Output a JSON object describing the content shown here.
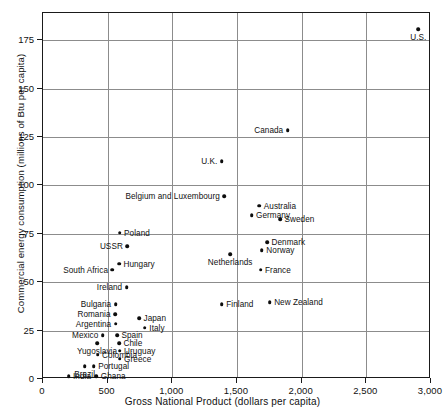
{
  "chart_data": {
    "type": "scatter",
    "title": "",
    "xlabel": "Gross National Product (dollars per capita)",
    "ylabel": "Commercial energy consumption (millions of Btu per capita)",
    "xlim": [
      0,
      3000
    ],
    "ylim": [
      0,
      189
    ],
    "xticks": [
      0,
      500,
      1000,
      1500,
      2000,
      2500,
      3000
    ],
    "xticklabels": [
      "0",
      "500",
      "1,000",
      "1,500",
      "2,000",
      "2,500",
      "3,000"
    ],
    "yticks": [
      0,
      25,
      50,
      75,
      100,
      125,
      150,
      175
    ],
    "yticklabels": [
      "0",
      "25",
      "50",
      "75",
      "100",
      "125",
      "150",
      "175"
    ],
    "grid": true,
    "legend": false,
    "points": [
      {
        "name": "U.S.",
        "x": 2910,
        "y": 180,
        "side": "below"
      },
      {
        "name": "Canada",
        "x": 1900,
        "y": 128,
        "side": "left"
      },
      {
        "name": "U.K.",
        "x": 1390,
        "y": 112,
        "side": "left"
      },
      {
        "name": "Belgium and Luxembourg",
        "x": 1410,
        "y": 94,
        "side": "left"
      },
      {
        "name": "Australia",
        "x": 1680,
        "y": 89,
        "side": "right"
      },
      {
        "name": "Germany",
        "x": 1620,
        "y": 84,
        "side": "right"
      },
      {
        "name": "Sweden",
        "x": 1840,
        "y": 82,
        "side": "right"
      },
      {
        "name": "Poland",
        "x": 600,
        "y": 75,
        "side": "right"
      },
      {
        "name": "Denmark",
        "x": 1740,
        "y": 70,
        "side": "right"
      },
      {
        "name": "Norway",
        "x": 1700,
        "y": 66,
        "side": "right"
      },
      {
        "name": "Netherlands",
        "x": 1455,
        "y": 64,
        "side": "below"
      },
      {
        "name": "USSR",
        "x": 660,
        "y": 68,
        "side": "left"
      },
      {
        "name": "Hungary",
        "x": 595,
        "y": 59,
        "side": "right"
      },
      {
        "name": "South Africa",
        "x": 545,
        "y": 56,
        "side": "left"
      },
      {
        "name": "France",
        "x": 1690,
        "y": 56,
        "side": "right"
      },
      {
        "name": "Ireland",
        "x": 655,
        "y": 47,
        "side": "left"
      },
      {
        "name": "New Zealand",
        "x": 1760,
        "y": 39,
        "side": "right"
      },
      {
        "name": "Finland",
        "x": 1390,
        "y": 38,
        "side": "right"
      },
      {
        "name": "Bulgaria",
        "x": 570,
        "y": 38,
        "side": "left"
      },
      {
        "name": "Romania",
        "x": 565,
        "y": 33,
        "side": "left"
      },
      {
        "name": "Japan",
        "x": 750,
        "y": 31,
        "side": "right"
      },
      {
        "name": "Argentina",
        "x": 570,
        "y": 28,
        "side": "left"
      },
      {
        "name": "Italy",
        "x": 795,
        "y": 26,
        "side": "right"
      },
      {
        "name": "Spain",
        "x": 580,
        "y": 22,
        "side": "right"
      },
      {
        "name": "Mexico",
        "x": 470,
        "y": 22,
        "side": "left"
      },
      {
        "name": "Chile",
        "x": 595,
        "y": 18,
        "side": "right"
      },
      {
        "name": "Yugoslavia",
        "x": 425,
        "y": 18,
        "side": "below"
      },
      {
        "name": "Uruguay",
        "x": 600,
        "y": 14,
        "side": "right"
      },
      {
        "name": "Colombia",
        "x": 430,
        "y": 12,
        "side": "right"
      },
      {
        "name": "Greece",
        "x": 600,
        "y": 10,
        "side": "right"
      },
      {
        "name": "Portugal",
        "x": 400,
        "y": 6,
        "side": "right"
      },
      {
        "name": "Brazil",
        "x": 330,
        "y": 6,
        "side": "below"
      },
      {
        "name": "India",
        "x": 205,
        "y": 1,
        "side": "right"
      },
      {
        "name": "Ghana",
        "x": 420,
        "y": 1,
        "side": "right"
      }
    ]
  }
}
